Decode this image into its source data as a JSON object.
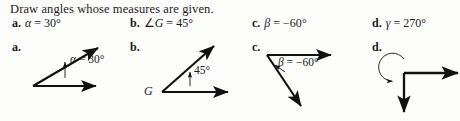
{
  "prompt": "Draw angles whose measures are given.",
  "questions": [
    {
      "letter": "a.",
      "var": "α",
      "eq": " = ",
      "value": "30",
      "degree": "°",
      "prefix": ""
    },
    {
      "letter": "b.",
      "var": "G",
      "eq": " = ",
      "value": "45",
      "degree": "°",
      "prefix": "∠"
    },
    {
      "letter": "c.",
      "var": "β",
      "eq": " = ",
      "value": "−60",
      "degree": "°",
      "prefix": ""
    },
    {
      "letter": "d.",
      "var": "γ",
      "eq": " = ",
      "value": "270",
      "degree": "°",
      "prefix": ""
    }
  ],
  "figures": [
    {
      "letter": "a.",
      "label_var": "α",
      "label_rest": " = 30°",
      "vertex_label": "",
      "description": "acute angle, horizontal ray right and ray up-right at 30 degrees, label with pointer into angle"
    },
    {
      "letter": "b.",
      "label_var": "",
      "label_rest": "45°",
      "vertex_label": "G",
      "description": "acute angle with vertex labeled G, horizontal ray right and ray up-right at 45 degrees"
    },
    {
      "letter": "c.",
      "label_var": "β",
      "label_rest": " = −60°",
      "vertex_label": "",
      "description": "negative angle, horizontal ray right and ray down-right, clockwise arrow"
    },
    {
      "letter": "d.",
      "label_var": "γ",
      "label_rest": " = 270°",
      "vertex_label": "",
      "description": "270 degree angle, horizontal ray right and vertical ray down, large counterclockwise circular arc arrow"
    }
  ],
  "colors": {
    "ink": "#111111",
    "page_background": "#fdfdfc"
  }
}
